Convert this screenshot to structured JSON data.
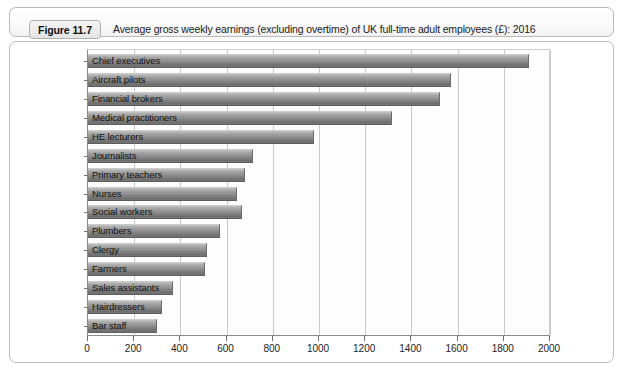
{
  "figure": {
    "badge_label": "Figure 11.7",
    "title": "Average gross weekly earnings (excluding overtime) of UK full-time adult employees (£): 2016"
  },
  "chart_data": {
    "type": "bar",
    "orientation": "horizontal",
    "title": "Average gross weekly earnings (excluding overtime) of UK full-time adult employees (£): 2016",
    "xlabel": "",
    "ylabel": "",
    "xlim": [
      0,
      2000
    ],
    "xticks": [
      0,
      200,
      400,
      600,
      800,
      1000,
      1200,
      1400,
      1600,
      1800,
      2000
    ],
    "tick_labels": [
      "0",
      "200",
      "400",
      "600",
      "800",
      "1000",
      "1200",
      "1400",
      "1600",
      "1800",
      "2000"
    ],
    "grid": true,
    "grid_axis": "x",
    "legend": "none",
    "units": "£ per week",
    "categories": [
      "Chief executives",
      "Aircraft pilots",
      "Financial brokers",
      "Medical practitioners",
      "HE lecturers",
      "Journalists",
      "Primary teachers",
      "Nurses",
      "Social workers",
      "Plumbers",
      "Clergy",
      "Farmers",
      "Sales assistants",
      "Hairdressers",
      "Bar staff"
    ],
    "values": [
      1910,
      1570,
      1525,
      1315,
      980,
      715,
      680,
      645,
      665,
      570,
      515,
      505,
      370,
      320,
      300
    ],
    "bar_color": "#8d8d8d",
    "bar_edge_color": "#5d5d5d"
  },
  "colors": {
    "frame_border": "#bdbdbd",
    "axis_line": "#8a8a8a",
    "gridline": "#c9c9c9",
    "plot_background": "#fdfdfd",
    "page_background": "#ffffff",
    "text": "#1b1b1b"
  }
}
